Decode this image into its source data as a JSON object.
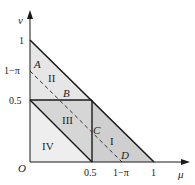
{
  "axes": {
    "y_label": "v",
    "x_label": "μ",
    "origin_label": "O"
  },
  "y_ticks": [
    {
      "label": "1",
      "y": 40
    },
    {
      "label": "1−π",
      "y": 71
    },
    {
      "label": "0.5",
      "y": 100
    }
  ],
  "x_ticks": [
    {
      "label": "0.5",
      "x": 92
    },
    {
      "label": "1−π",
      "x": 122
    },
    {
      "label": "1",
      "x": 154
    }
  ],
  "points": {
    "A": "A",
    "B": "B",
    "C": "C",
    "D": "D"
  },
  "regions": {
    "I": "I",
    "II": "II",
    "III": "III",
    "IV": "IV"
  },
  "colors": {
    "region_light": "#ebebeb",
    "region_mid": "#d9d9d9",
    "region_dark": "#c4c4c4",
    "line": "#1a1a1a"
  }
}
